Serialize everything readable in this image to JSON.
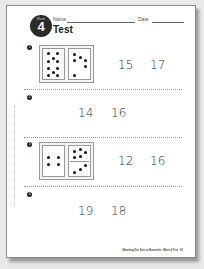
{
  "header": {
    "badge_label": "Week",
    "badge_number": "4",
    "name_label": "Name",
    "date_label": "Date",
    "title": "Test"
  },
  "questions": [
    {
      "number": "1",
      "domino": {
        "left_dots": 10,
        "right_dots": 6
      },
      "choices": [
        "15",
        "17"
      ]
    },
    {
      "number": "2",
      "choices": [
        "14",
        "16"
      ]
    },
    {
      "number": "3",
      "domino": {
        "left_dots": 4,
        "right_dots": 8
      },
      "choices": [
        "12",
        "16"
      ]
    },
    {
      "number": "4",
      "choices": [
        "19",
        "18"
      ]
    }
  ],
  "footer": {
    "text": "Matching Dot Sets to Numerals • Week 4 Test",
    "page_number": "81"
  }
}
